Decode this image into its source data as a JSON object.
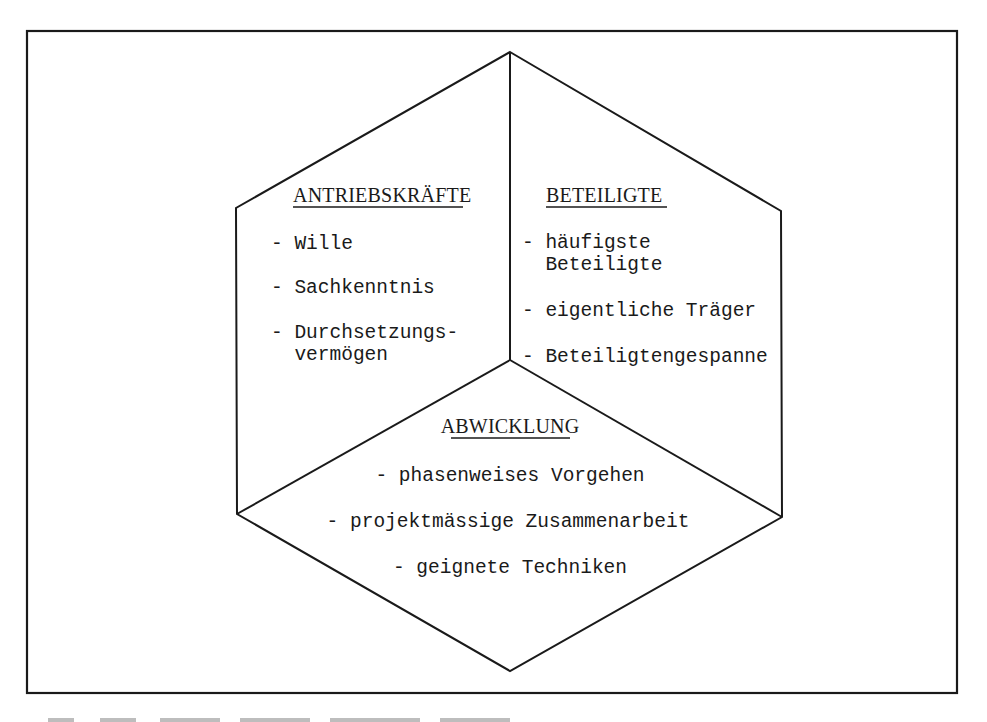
{
  "diagram": {
    "type": "cube-hexagon",
    "sections": [
      {
        "id": "antriebskraefte",
        "title": "ANTRIEBSKRÄFTE",
        "items": [
          [
            "- Wille"
          ],
          [
            "- Sachkenntnis"
          ],
          [
            "- Durchsetzungs-",
            "  vermögen"
          ]
        ]
      },
      {
        "id": "beteiligte",
        "title": "BETEILIGTE",
        "items": [
          [
            "- häufigste",
            "  Beteiligte"
          ],
          [
            "- eigentliche Träger"
          ],
          [
            "- Beteiligtengespanne"
          ]
        ]
      },
      {
        "id": "abwicklung",
        "title": "ABWICKLUNG",
        "items": [
          [
            "- phasenweises Vorgehen"
          ],
          [
            "- projektmässige Zusammenarbeit"
          ],
          [
            "- geignete Techniken"
          ]
        ]
      }
    ],
    "colors": {
      "ink": "#1a1a1a",
      "paper": "#ffffff"
    }
  }
}
